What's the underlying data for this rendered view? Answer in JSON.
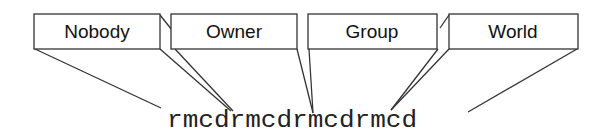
{
  "diagram": {
    "groups": [
      {
        "label": "Nobody"
      },
      {
        "label": "Owner"
      },
      {
        "label": "Group"
      },
      {
        "label": "World"
      }
    ],
    "bit_string": "rmcdrmcdrmcdrmcd"
  }
}
